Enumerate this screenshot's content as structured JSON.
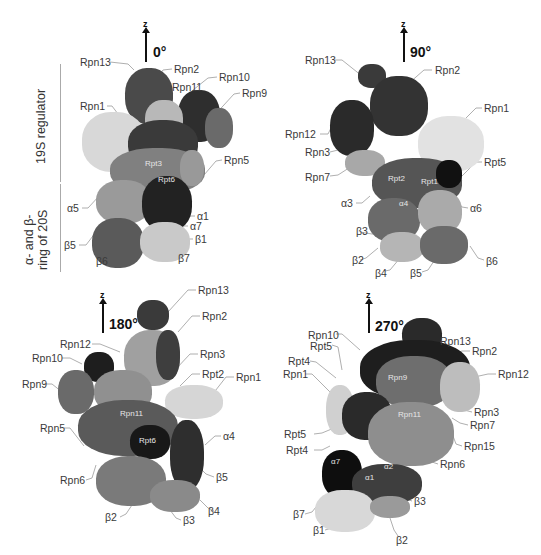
{
  "figure": {
    "axis_label": "z",
    "side_labels": {
      "regulator": "19S regulator",
      "core_line1": "α- and β-",
      "core_line2": "ring of 20S"
    },
    "panels": [
      {
        "angle": "0°",
        "labels": [
          "Rpn13",
          "Rpn2",
          "Rpn10",
          "Rpn11",
          "Rpn9",
          "Rpn1",
          "Rpn5",
          "α5",
          "α1",
          "α7",
          "β1",
          "β5",
          "β6",
          "β7"
        ],
        "inner_labels": [
          "Rpt3",
          "Rpt6"
        ]
      },
      {
        "angle": "90°",
        "labels": [
          "Rpn13",
          "Rpn2",
          "Rpn1",
          "Rpn12",
          "Rpn3",
          "Rpn7",
          "Rpt5",
          "α3",
          "α6",
          "β3",
          "β2",
          "β4",
          "β5",
          "β6"
        ],
        "inner_labels": [
          "Rpt2",
          "Rpt1",
          "α4"
        ]
      },
      {
        "angle": "180°",
        "labels": [
          "Rpn13",
          "Rpn2",
          "Rpn12",
          "Rpn3",
          "Rpn10",
          "Rpt2",
          "Rpn1",
          "Rpn9",
          "Rpn5",
          "α4",
          "Rpn6",
          "β5",
          "β4",
          "β2",
          "β3"
        ],
        "inner_labels": [
          "Rpt6",
          "Rpn11"
        ]
      },
      {
        "angle": "270°",
        "labels": [
          "Rpn10",
          "Rpn13",
          "Rpt5",
          "Rpn2",
          "Rpt4",
          "Rpn1",
          "Rpn12",
          "Rpn3",
          "Rpn7",
          "Rpt5",
          "Rpn15",
          "Rpt4",
          "Rpn6",
          "β3",
          "β7",
          "β1",
          "β2"
        ],
        "inner_labels": [
          "Rpn9",
          "Rpn11",
          "α7",
          "α1",
          "α2"
        ]
      }
    ]
  }
}
